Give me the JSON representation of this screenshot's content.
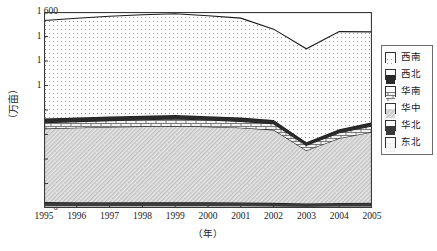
{
  "chart_data": {
    "type": "area",
    "stacked": true,
    "title": "",
    "xlabel": "（年）",
    "ylabel": "（万亩）",
    "x": [
      1995,
      1996,
      1997,
      1998,
      1999,
      2000,
      2001,
      2002,
      2003,
      2004,
      2005
    ],
    "xtick_labels": [
      "1995",
      "1996",
      "1997",
      "1998",
      "1999",
      "2000",
      "2001",
      "2002",
      "2003",
      "2004",
      "2005"
    ],
    "ylim": [
      0,
      1600
    ],
    "ytick_values": [
      0,
      200,
      400,
      600,
      800,
      1000,
      1200,
      1400,
      1600
    ],
    "ytick_labels": [
      "0",
      "200",
      "400",
      "600",
      "800",
      "1 000",
      "1 200",
      "1 400",
      "1 600"
    ],
    "grid": false,
    "legend_position": "right",
    "stack_order_bottom_to_top": [
      "东北",
      "华北",
      "华中",
      "华南",
      "西北",
      "西南"
    ],
    "series": [
      {
        "name": "东北",
        "pattern": "light-grid",
        "values": [
          18,
          18,
          18,
          18,
          18,
          18,
          18,
          16,
          14,
          16,
          17
        ]
      },
      {
        "name": "华北",
        "pattern": "solid-dark",
        "values": [
          30,
          29,
          29,
          28,
          28,
          28,
          27,
          26,
          22,
          25,
          26
        ]
      },
      {
        "name": "华中",
        "pattern": "diagonal-hatch",
        "values": [
          600,
          608,
          614,
          620,
          624,
          618,
          610,
          596,
          434,
          528,
          578
        ]
      },
      {
        "name": "华南",
        "pattern": "brick",
        "values": [
          48,
          50,
          52,
          54,
          56,
          54,
          52,
          50,
          42,
          46,
          48
        ]
      },
      {
        "name": "西北",
        "pattern": "solid-black",
        "values": [
          34,
          34,
          34,
          34,
          34,
          32,
          31,
          30,
          24,
          28,
          30
        ]
      },
      {
        "name": "西南",
        "pattern": "fine-dots",
        "values": [
          800,
          810,
          818,
          824,
          826,
          820,
          812,
          742,
          764,
          797,
          739
        ]
      }
    ],
    "totals": [
      1530,
      1549,
      1565,
      1578,
      1586,
      1570,
      1550,
      1460,
      1300,
      1440,
      1438
    ],
    "annotations": []
  },
  "legend": {
    "items": [
      {
        "label": "西南",
        "pattern": "fine-dots"
      },
      {
        "label": "西北",
        "pattern": "solid-black"
      },
      {
        "label": "华南",
        "pattern": "brick"
      },
      {
        "label": "华中",
        "pattern": "diagonal-hatch"
      },
      {
        "label": "华北",
        "pattern": "solid-dark"
      },
      {
        "label": "东北",
        "pattern": "light-grid"
      }
    ]
  }
}
